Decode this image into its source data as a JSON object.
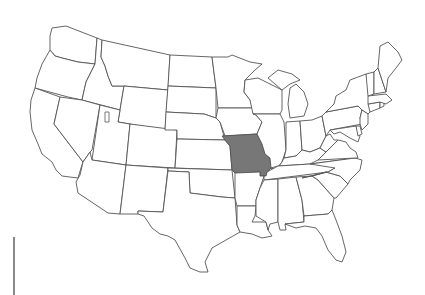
{
  "map": {
    "title": "",
    "region": "United States (contiguous)",
    "highlighted_state": "Missouri",
    "colors": {
      "background": "#ffffff",
      "state_fill": "#ffffff",
      "state_stroke": "#555555",
      "highlight_fill": "#777777"
    },
    "states": [
      {
        "id": "WA",
        "name": "Washington",
        "d": "M52,28 L66,26 L97,38 L95,64 L78,62 L62,58 L55,56 L50,50 L50,36 Z"
      },
      {
        "id": "OR",
        "name": "Oregon",
        "d": "M50,50 L55,56 L62,58 L78,62 L95,64 L92,70 L86,82 L82,100 L68,97 L35,88 L37,78 L42,64 Z"
      },
      {
        "id": "CA",
        "name": "California",
        "d": "M35,88 L60,97 L54,124 L83,162 L81,168 L78,178 L62,176 L56,170 L52,162 L42,154 L38,144 L32,130 L30,112 L31,100 Z"
      },
      {
        "id": "ID",
        "name": "Idaho",
        "d": "M97,38 L102,40 L101,57 L105,66 L108,76 L112,86 L124,86 L120,110 L82,100 L86,82 L92,70 L95,64 Z"
      },
      {
        "id": "NV",
        "name": "Nevada",
        "d": "M60,97 L82,100 L100,105 L92,150 L90,152 L83,162 L54,124 Z"
      },
      {
        "id": "MT",
        "name": "Montana",
        "d": "M102,40 L170,55 L168,90 L124,86 L112,86 L108,76 L105,66 L101,57 Z"
      },
      {
        "id": "WY",
        "name": "Wyoming",
        "d": "M124,86 L168,90 L165,130 L118,122 Z"
      },
      {
        "id": "UT",
        "name": "Utah",
        "d": "M100,105 L120,110 L118,122 L130,124 L126,165 L92,160 Z"
      },
      {
        "id": "AZ",
        "name": "Arizona",
        "d": "M92,160 L126,165 L120,214 L108,213 L78,193 L76,182 L80,175 L83,162 L90,152 Z"
      },
      {
        "id": "CO",
        "name": "Colorado",
        "d": "M130,124 L177,130 L175,168 L126,165 Z"
      },
      {
        "id": "NM",
        "name": "New Mexico",
        "d": "M126,165 L168,168 L163,212 L138,211 L138,214 L125,214 L120,214 Z"
      },
      {
        "id": "ND",
        "name": "North Dakota",
        "d": "M170,55 L212,57 L216,88 L168,86 Z"
      },
      {
        "id": "SD",
        "name": "South Dakota",
        "d": "M168,86 L216,88 L216,118 L204,114 L166,112 Z"
      },
      {
        "id": "NE",
        "name": "Nebraska",
        "d": "M166,112 L204,114 L216,118 L220,122 L225,140 L177,139 L177,130 L165,130 Z"
      },
      {
        "id": "KS",
        "name": "Kansas",
        "d": "M177,139 L225,140 L230,146 L232,170 L175,168 Z"
      },
      {
        "id": "OK",
        "name": "Oklahoma",
        "d": "M168,168 L232,170 L235,198 L222,197 L206,195 L190,193 L189,172 L168,171 Z"
      },
      {
        "id": "TX",
        "name": "Texas",
        "d": "M168,171 L189,172 L190,193 L206,195 L222,197 L235,198 L237,225 L240,232 L226,240 L212,248 L205,262 L208,272 L200,272 L190,268 L185,258 L175,240 L168,236 L160,234 L152,228 L144,216 L138,214 L138,211 L163,212 Z"
      },
      {
        "id": "MN",
        "name": "Minnesota",
        "d": "M212,57 L228,57 L232,55 L250,62 L262,64 L255,70 L245,80 L244,92 L250,100 L253,108 L218,108 L216,88 Z"
      },
      {
        "id": "IA",
        "name": "Iowa",
        "d": "M218,108 L253,108 L256,115 L262,122 L257,134 L225,136 L220,122 L216,118 Z"
      },
      {
        "id": "MO",
        "name": "Missouri",
        "highlighted": true,
        "d": "M222,136 L257,134 L262,144 L265,154 L270,158 L271,168 L267,172 L266,176 L260,176 L260,172 L235,173 L232,170 L230,146 L225,140 Z"
      },
      {
        "id": "AR",
        "name": "Arkansas",
        "d": "M235,173 L260,172 L260,176 L264,176 L260,188 L256,200 L256,206 L237,206 L235,198 Z"
      },
      {
        "id": "LA",
        "name": "Louisiana",
        "d": "M237,206 L256,206 L255,216 L252,222 L266,222 L268,230 L272,236 L262,238 L252,234 L240,232 L237,225 Z"
      },
      {
        "id": "WI",
        "name": "Wisconsin",
        "d": "M245,80 L258,78 L270,84 L282,90 L282,110 L280,114 L253,114 L250,100 L244,92 Z"
      },
      {
        "id": "IL",
        "name": "Illinois",
        "d": "M253,114 L280,114 L284,122 L286,150 L282,162 L276,170 L271,168 L270,158 L265,154 L262,144 L257,134 L262,122 L256,115 Z"
      },
      {
        "id": "MI",
        "name": "Michigan",
        "d": "M268,78 L278,70 L292,74 L300,80 L290,84 L282,90 Z M290,88 L296,84 L304,92 L308,104 L304,116 L290,118 L288,104 Z"
      },
      {
        "id": "IN",
        "name": "Indiana",
        "d": "M286,122 L300,121 L302,150 L296,156 L284,158 L286,150 Z"
      },
      {
        "id": "OH",
        "name": "Ohio",
        "d": "M300,121 L312,120 L322,116 L326,136 L320,148 L310,152 L302,150 Z"
      },
      {
        "id": "KY",
        "name": "Kentucky",
        "d": "M271,168 L276,170 L282,162 L284,158 L296,156 L302,150 L310,152 L320,148 L326,152 L318,160 L310,164 L278,166 Z"
      },
      {
        "id": "TN",
        "name": "Tennessee",
        "d": "M264,176 L266,176 L267,172 L278,166 L310,164 L355,158 L348,164 L335,168 L328,172 L264,180 Z"
      },
      {
        "id": "MS",
        "name": "Mississippi",
        "d": "M260,188 L264,180 L278,179 L278,222 L270,224 L268,230 L266,222 L256,216 L256,206 L256,200 Z"
      },
      {
        "id": "AL",
        "name": "Alabama",
        "d": "M278,179 L296,177 L302,200 L304,222 L285,224 L286,230 L280,230 L278,222 Z"
      },
      {
        "id": "GA",
        "name": "Georgia",
        "d": "M296,177 L312,176 L318,180 L334,198 L332,210 L328,214 L304,216 L302,200 Z"
      },
      {
        "id": "FL",
        "name": "Florida",
        "d": "M285,224 L304,222 L304,216 L328,214 L332,210 L336,220 L342,236 L346,252 L342,262 L336,260 L328,250 L322,236 L316,228 L305,226 L296,228 Z"
      },
      {
        "id": "SC",
        "name": "South Carolina",
        "d": "M312,176 L326,172 L340,176 L348,184 L336,198 L334,198 L318,180 Z"
      },
      {
        "id": "NC",
        "name": "North Carolina",
        "d": "M310,164 L355,158 L362,160 L360,170 L350,180 L348,184 L340,176 L326,172 L312,176 L302,178 L328,172 L335,168 Z"
      },
      {
        "id": "VA",
        "name": "Virginia",
        "d": "M318,160 L326,152 L332,146 L338,140 L346,142 L350,148 L356,152 L358,158 L355,158 Z"
      },
      {
        "id": "WV",
        "name": "West Virginia",
        "d": "M320,148 L326,136 L330,134 L334,140 L338,140 L332,146 L326,152 Z"
      },
      {
        "id": "PA",
        "name": "Pennsylvania",
        "d": "M322,116 L326,112 L358,106 L362,110 L360,118 L362,124 L330,130 L326,136 Z"
      },
      {
        "id": "NY",
        "name": "New York",
        "d": "M326,112 L334,104 L336,96 L346,90 L350,80 L366,74 L372,90 L374,102 L372,110 L368,114 L362,110 L358,106 Z"
      },
      {
        "id": "MD",
        "name": "Maryland",
        "d": "M330,130 L356,126 L360,136 L358,142 L350,138 L340,132 L334,134 Z"
      },
      {
        "id": "DE",
        "name": "Delaware",
        "d": "M356,126 L360,126 L362,134 L358,136 Z"
      },
      {
        "id": "NJ",
        "name": "New Jersey",
        "d": "M362,110 L368,114 L368,124 L362,130 L360,124 L360,118 Z"
      },
      {
        "id": "CT",
        "name": "Connecticut",
        "d": "M368,104 L380,102 L380,108 L370,112 Z"
      },
      {
        "id": "RI",
        "name": "Rhode Island",
        "d": "M380,102 L384,102 L384,106 L380,108 Z"
      },
      {
        "id": "MA",
        "name": "Massachusetts",
        "d": "M368,96 L386,94 L392,100 L386,104 L380,102 L368,104 Z"
      },
      {
        "id": "VT",
        "name": "Vermont",
        "d": "M366,74 L374,72 L374,94 L368,96 Z"
      },
      {
        "id": "NH",
        "name": "New Hampshire",
        "d": "M374,72 L378,68 L386,92 L374,94 Z"
      },
      {
        "id": "ME",
        "name": "Maine",
        "d": "M378,68 L380,46 L388,42 L398,52 L402,60 L396,68 L388,78 L386,92 Z"
      }
    ],
    "lakes": [
      {
        "name": "Great Salt Lake",
        "d": "M105,112 L109,112 L109,122 L105,122 Z"
      }
    ],
    "scale_bar": {
      "visible": true
    }
  }
}
